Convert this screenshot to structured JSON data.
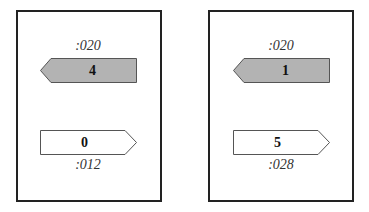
{
  "panels": [
    {
      "top_label": ":020",
      "left_arrow": {
        "value": "4",
        "direction": "left",
        "fill": "#b3b3b3"
      },
      "right_arrow": {
        "value": "0",
        "direction": "right",
        "fill": "#ffffff"
      },
      "bottom_label": ":012"
    },
    {
      "top_label": ":020",
      "left_arrow": {
        "value": "1",
        "direction": "left",
        "fill": "#b3b3b3"
      },
      "right_arrow": {
        "value": "5",
        "direction": "right",
        "fill": "#ffffff"
      },
      "bottom_label": ":028"
    }
  ]
}
